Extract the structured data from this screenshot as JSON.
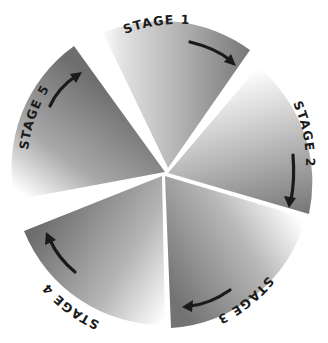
{
  "diagram": {
    "type": "cycle",
    "colors": {
      "wedge_dark": "#6e6e6e",
      "wedge_light": "#ffffff",
      "arrow": "#1a1a1a",
      "label": "#1c1c1c",
      "background": "#ffffff"
    },
    "stages": [
      {
        "id": 1,
        "label": "STAGE 1",
        "arrow_direction": "clockwise"
      },
      {
        "id": 2,
        "label": "STAGE 2",
        "arrow_direction": "clockwise"
      },
      {
        "id": 3,
        "label": "STAGE 3",
        "arrow_direction": "clockwise"
      },
      {
        "id": 4,
        "label": "STAGE 4",
        "arrow_direction": "clockwise"
      },
      {
        "id": 5,
        "label": "STAGE 5",
        "arrow_direction": "clockwise"
      }
    ]
  }
}
